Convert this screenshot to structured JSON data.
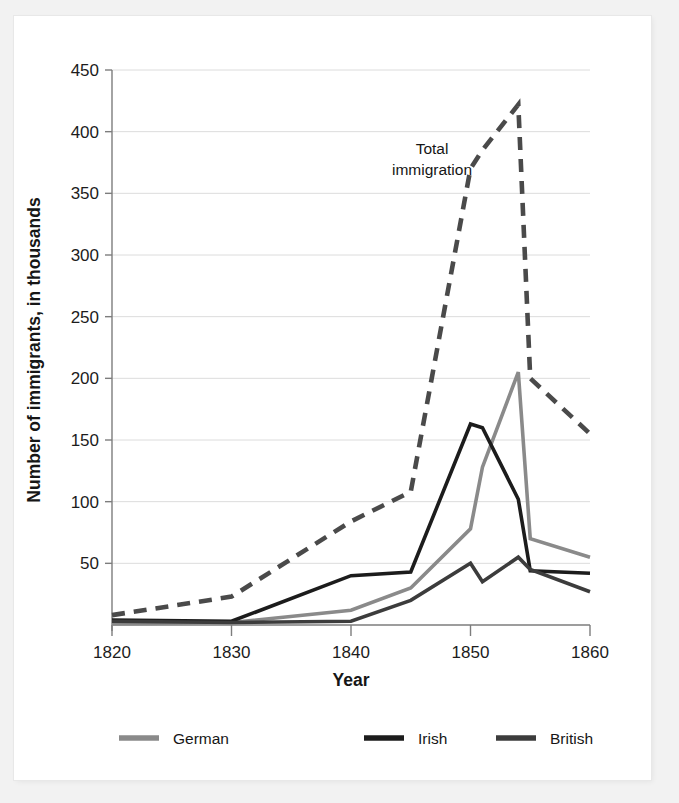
{
  "chart_data": {
    "type": "line",
    "title": "",
    "xlabel": "Year",
    "ylabel": "Number of immigrants, in thousands",
    "xlim": [
      1820,
      1860
    ],
    "ylim": [
      0,
      450
    ],
    "xticks": [
      1820,
      1830,
      1840,
      1850,
      1860
    ],
    "yticks": [
      0,
      50,
      100,
      150,
      200,
      250,
      300,
      350,
      400,
      450
    ],
    "xtick_labels": [
      "1820",
      "1830",
      "1840",
      "1850",
      "1860"
    ],
    "ytick_labels": [
      "50",
      "100",
      "150",
      "200",
      "250",
      "300",
      "350",
      "400",
      "450"
    ],
    "grid": "horizontal",
    "legend_position": "bottom",
    "annotations": [
      {
        "text": "Total immigration",
        "line1": "Total",
        "line2": "immigration",
        "x": 1846.5,
        "y": 385
      }
    ],
    "series": [
      {
        "name": "Total immigration",
        "style": "dashed",
        "color": "#4a4a4a",
        "in_legend": false,
        "x": [
          1820,
          1830,
          1840,
          1845,
          1850,
          1851,
          1854,
          1855,
          1860
        ],
        "values": [
          8,
          23,
          84,
          108,
          370,
          385,
          422,
          200,
          155
        ]
      },
      {
        "name": "German",
        "style": "solid",
        "color": "#8a8a8a",
        "in_legend": true,
        "x": [
          1820,
          1830,
          1840,
          1845,
          1850,
          1851,
          1854,
          1855,
          1860
        ],
        "values": [
          1,
          2,
          12,
          30,
          78,
          128,
          205,
          70,
          55
        ]
      },
      {
        "name": "Irish",
        "style": "solid",
        "color": "#1c1c1c",
        "in_legend": true,
        "x": [
          1820,
          1830,
          1840,
          1845,
          1850,
          1851,
          1854,
          1855,
          1860
        ],
        "values": [
          4,
          3,
          40,
          43,
          163,
          160,
          102,
          44,
          42
        ]
      },
      {
        "name": "British",
        "style": "solid",
        "color": "#3c3c3c",
        "in_legend": true,
        "x": [
          1820,
          1830,
          1840,
          1845,
          1850,
          1851,
          1854,
          1855,
          1860
        ],
        "values": [
          3,
          2,
          3,
          20,
          50,
          35,
          55,
          45,
          27
        ]
      }
    ],
    "legend": [
      {
        "label": "German",
        "color": "#8a8a8a"
      },
      {
        "label": "Irish",
        "color": "#1c1c1c"
      },
      {
        "label": "British",
        "color": "#3c3c3c"
      }
    ]
  },
  "colors": {
    "background": "#f2f2f2",
    "card": "#ffffff",
    "axis": "#7d7d7d",
    "grid": "#dcdcdc",
    "text": "#161616"
  }
}
